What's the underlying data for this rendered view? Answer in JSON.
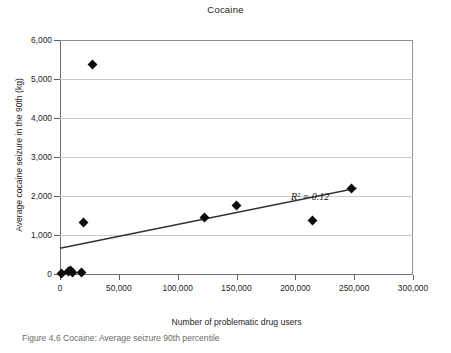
{
  "chart_data": {
    "type": "scatter",
    "title": "Cocaine",
    "xlabel": "Number of problematic drug users",
    "ylabel": "Average cocaine seizure in the 90th (kg)",
    "xlim": [
      0,
      300000
    ],
    "ylim": [
      0,
      6000
    ],
    "grid": true,
    "legend": "none",
    "xticks": [
      0,
      50000,
      100000,
      150000,
      200000,
      250000,
      300000
    ],
    "xtick_labels": [
      "0",
      "50,000",
      "100,000",
      "150,000",
      "200,000",
      "250,000",
      "300,000"
    ],
    "yticks": [
      0,
      1000,
      2000,
      3000,
      4000,
      5000,
      6000
    ],
    "ytick_labels": [
      "0",
      "1,000",
      "2,000",
      "3,000",
      "4,000",
      "5,000",
      "6,000"
    ],
    "series": [
      {
        "name": "Countries",
        "marker": "diamond",
        "color": "#0d0d0d",
        "points": [
          {
            "x": 1500,
            "y": 20
          },
          {
            "x": 7000,
            "y": 60
          },
          {
            "x": 9000,
            "y": 90
          },
          {
            "x": 11000,
            "y": 40
          },
          {
            "x": 18000,
            "y": 30
          },
          {
            "x": 20000,
            "y": 1330
          },
          {
            "x": 28000,
            "y": 5380
          },
          {
            "x": 123000,
            "y": 1440
          },
          {
            "x": 150000,
            "y": 1760
          },
          {
            "x": 215000,
            "y": 1370
          },
          {
            "x": 248000,
            "y": 2180
          }
        ]
      }
    ],
    "trendline": {
      "type": "linear",
      "color": "#333333",
      "x_start": 0,
      "y_start": 660,
      "x_end": 252000,
      "y_end": 2200,
      "r_squared": 0.12,
      "annotation": "R² = 0.12"
    }
  },
  "caption": "Figure 4.6 Cocaine: Average seizure 90th percentile"
}
